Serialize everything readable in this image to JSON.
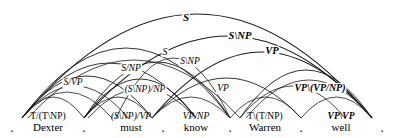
{
  "diagram": {
    "sentence": "Dexter must know Warren well",
    "stroke_color": "#1a1a1a",
    "dot_color": "#6a6a6a",
    "background": "#ffffff",
    "width": 394,
    "height": 138
  },
  "lexicon": [
    {
      "word": "Dexter",
      "category": "T/(T\\NP)",
      "x": 48,
      "bold": false,
      "upright": true
    },
    {
      "word": "must",
      "category": "(S\\NP)/VP",
      "x": 131,
      "bold": false,
      "upright": false
    },
    {
      "word": "know",
      "category": "VP/NP",
      "x": 196,
      "bold": false,
      "upright": false
    },
    {
      "word": "Warren",
      "category": "T\\(T/NP)",
      "x": 265,
      "bold": false,
      "upright": true
    },
    {
      "word": "well",
      "category": "VP\\VP",
      "x": 341,
      "bold": true,
      "upright": false
    }
  ],
  "boundary_dots": [
    {
      "x": 12,
      "y": 131
    },
    {
      "x": 84,
      "y": 131
    },
    {
      "x": 163,
      "y": 131
    },
    {
      "x": 230,
      "y": 131
    },
    {
      "x": 301,
      "y": 131
    },
    {
      "x": 382,
      "y": 131
    }
  ],
  "arcs": [
    {
      "id": "arc-s-top",
      "label": "S",
      "from": 22,
      "to": 372,
      "apex_y": 14,
      "label_x": 186,
      "label_y": 17,
      "bold": true,
      "size": 11,
      "width": 1.1
    },
    {
      "id": "arc-s-np",
      "label": "S\\NP",
      "from": 84,
      "to": 372,
      "apex_y": 36,
      "label_x": 240,
      "label_y": 36,
      "bold": true,
      "size": 10.5,
      "width": 1.1
    },
    {
      "id": "arc-vp-upper",
      "label": "VP",
      "from": 152,
      "to": 372,
      "apex_y": 52,
      "label_x": 272,
      "label_y": 51,
      "bold": true,
      "size": 10.5,
      "width": 1.1
    },
    {
      "id": "arc-s-mid",
      "label": "S",
      "from": 22,
      "to": 230,
      "apex_y": 48,
      "label_x": 165,
      "label_y": 52,
      "bold": false,
      "size": 10,
      "width": 0.9
    },
    {
      "id": "arc-s-np-mid",
      "label": "S\\NP",
      "from": 84,
      "to": 230,
      "apex_y": 62,
      "label_x": 190,
      "label_y": 62,
      "bold": false,
      "size": 9.5,
      "width": 0.9
    },
    {
      "id": "arc-s-np-slash",
      "label": "S/NP",
      "from": 22,
      "to": 196,
      "apex_y": 63,
      "label_x": 131,
      "label_y": 69,
      "bold": false,
      "size": 9.5,
      "width": 0.9
    },
    {
      "id": "arc-s-vp",
      "label": "S/VP",
      "from": 22,
      "to": 152,
      "apex_y": 76,
      "label_x": 73,
      "label_y": 83,
      "bold": false,
      "size": 9.5,
      "width": 0.9
    },
    {
      "id": "arc-snp-np",
      "label": "(S\\NP)/NP",
      "from": 84,
      "to": 196,
      "apex_y": 79,
      "label_x": 145,
      "label_y": 90,
      "bold": false,
      "size": 9.5,
      "width": 0.9
    },
    {
      "id": "arc-vp-lower",
      "label": "VP",
      "from": 152,
      "to": 301,
      "apex_y": 78,
      "label_x": 223,
      "label_y": 89,
      "bold": false,
      "size": 9.5,
      "width": 0.9
    },
    {
      "id": "arc-vp-vp-np",
      "label": "VP\\(VP/NP)",
      "from": 240,
      "to": 372,
      "apex_y": 70,
      "label_x": 320,
      "label_y": 88,
      "bold": true,
      "size": 10,
      "width": 0.9
    },
    {
      "id": "arc-unlabeled-1",
      "label": "",
      "from": 22,
      "to": 84,
      "apex_y": 97,
      "label_x": 0,
      "label_y": 0,
      "bold": false,
      "size": 9,
      "width": 0.8
    },
    {
      "id": "arc-unlabeled-2",
      "label": "",
      "from": 84,
      "to": 152,
      "apex_y": 97,
      "label_x": 0,
      "label_y": 0,
      "bold": false,
      "size": 9,
      "width": 0.8
    },
    {
      "id": "arc-unlabeled-3",
      "label": "",
      "from": 152,
      "to": 230,
      "apex_y": 97,
      "label_x": 0,
      "label_y": 0,
      "bold": false,
      "size": 9,
      "width": 0.8
    },
    {
      "id": "arc-unlabeled-4",
      "label": "",
      "from": 230,
      "to": 301,
      "apex_y": 97,
      "label_x": 0,
      "label_y": 0,
      "bold": false,
      "size": 9,
      "width": 0.8
    },
    {
      "id": "arc-unlabeled-5",
      "label": "",
      "from": 301,
      "to": 372,
      "apex_y": 97,
      "label_x": 0,
      "label_y": 0,
      "bold": false,
      "size": 9,
      "width": 0.8
    },
    {
      "id": "arc-fan-1",
      "label": "",
      "from": 22,
      "to": 128,
      "apex_y": 86,
      "label_x": 0,
      "label_y": 0,
      "bold": false,
      "size": 9,
      "width": 0.8
    },
    {
      "id": "arc-fan-2",
      "label": "",
      "from": 22,
      "to": 112,
      "apex_y": 92,
      "label_x": 0,
      "label_y": 0,
      "bold": false,
      "size": 9,
      "width": 0.8
    },
    {
      "id": "arc-fan-3",
      "label": "",
      "from": 88,
      "to": 196,
      "apex_y": 88,
      "label_x": 0,
      "label_y": 0,
      "bold": false,
      "size": 9,
      "width": 0.8
    },
    {
      "id": "arc-fan-4",
      "label": "",
      "from": 240,
      "to": 345,
      "apex_y": 86,
      "label_x": 0,
      "label_y": 0,
      "bold": false,
      "size": 9,
      "width": 0.8
    },
    {
      "id": "arc-fan-5",
      "label": "",
      "from": 246,
      "to": 372,
      "apex_y": 80,
      "label_x": 0,
      "label_y": 0,
      "bold": false,
      "size": 9,
      "width": 0.8
    },
    {
      "id": "arc-cross-1",
      "label": "",
      "from": 116,
      "to": 230,
      "apex_y": 58,
      "label_x": 0,
      "label_y": 0,
      "bold": false,
      "size": 9,
      "width": 0.8
    },
    {
      "id": "arc-cross-2",
      "label": "",
      "from": 28,
      "to": 240,
      "apex_y": 60,
      "label_x": 0,
      "label_y": 0,
      "bold": false,
      "size": 9,
      "width": 0.8
    }
  ]
}
